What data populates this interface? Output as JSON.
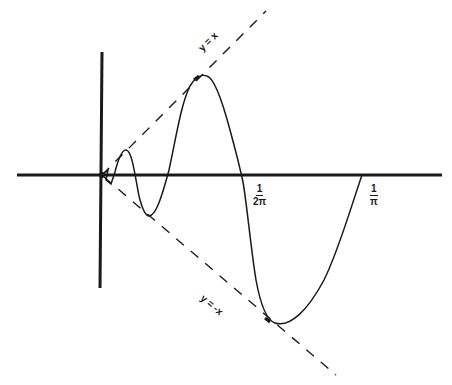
{
  "diagram": {
    "curve": "y = x sin(1/x)",
    "envelopes": [
      {
        "id": "upper",
        "label": "y = x",
        "style": "dashed"
      },
      {
        "id": "lower",
        "label": "y = -x",
        "style": "dashed"
      }
    ],
    "x_ticks": [
      {
        "id": "one-over-two-pi",
        "numerator": "1",
        "denominator": "2π"
      },
      {
        "id": "one-over-pi",
        "numerator": "1",
        "denominator": "π"
      }
    ],
    "colors": {
      "ink": "#1a1a1a",
      "background": "#ffffff"
    }
  }
}
